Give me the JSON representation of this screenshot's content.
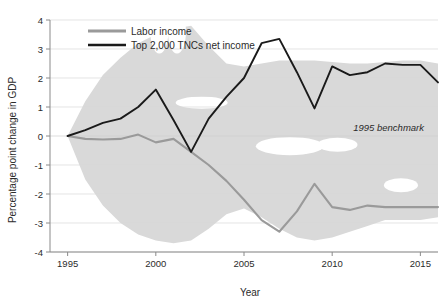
{
  "chart_data": {
    "type": "line",
    "title": "",
    "xlabel": "Year",
    "ylabel": "Percentage point change in GDP",
    "xlim": [
      1994,
      2016
    ],
    "ylim": [
      -4,
      4
    ],
    "grid": true,
    "legend_position": "top-left",
    "xticks": [
      1995,
      2000,
      2005,
      2010,
      2015
    ],
    "yticks": [
      -4,
      -3,
      -2,
      -1,
      0,
      1,
      2,
      3,
      4
    ],
    "xtick_labels": [
      "1995",
      "2000",
      "2005",
      "2010",
      "2015"
    ],
    "ytick_labels": [
      "-4",
      "-3",
      "-2",
      "-1",
      "0",
      "1",
      "2",
      "3",
      "4"
    ],
    "x": [
      1995,
      1996,
      1997,
      1998,
      1999,
      2000,
      2001,
      2002,
      2003,
      2004,
      2005,
      2006,
      2007,
      2008,
      2009,
      2010,
      2011,
      2012,
      2013,
      2014,
      2015,
      2016
    ],
    "series": [
      {
        "name": "Labor income",
        "color": "#9a9a9a",
        "values": [
          0.0,
          -0.1,
          -0.12,
          -0.1,
          0.05,
          -0.22,
          -0.1,
          -0.55,
          -1.0,
          -1.55,
          -2.2,
          -2.9,
          -3.3,
          -2.6,
          -1.65,
          -2.45,
          -2.55,
          -2.4,
          -2.45,
          -2.45,
          -2.45,
          -2.45
        ]
      },
      {
        "name": "Top 2,000 TNCs net income",
        "color": "#1a1a1a",
        "values": [
          0.0,
          0.2,
          0.45,
          0.6,
          1.0,
          1.6,
          0.55,
          -0.55,
          0.6,
          1.35,
          2.0,
          3.2,
          3.35,
          2.2,
          0.95,
          2.4,
          2.1,
          2.2,
          2.5,
          2.45,
          2.45,
          1.85
        ]
      }
    ],
    "band": {
      "name": "range-band",
      "color": "#d9d9d9",
      "upper": [
        0.0,
        1.2,
        2.1,
        2.7,
        3.2,
        3.5,
        3.7,
        3.8,
        3.1,
        2.5,
        2.4,
        2.5,
        2.6,
        2.6,
        2.6,
        2.55,
        2.5,
        2.5,
        2.55,
        2.6,
        2.6,
        2.5
      ],
      "lower": [
        0.0,
        -1.5,
        -2.4,
        -3.0,
        -3.4,
        -3.6,
        -3.7,
        -3.6,
        -3.2,
        -2.7,
        -2.5,
        -2.8,
        -3.2,
        -3.5,
        -3.6,
        -3.5,
        -3.3,
        -3.1,
        -2.9,
        -2.9,
        -2.9,
        -2.8
      ]
    },
    "annotations": [
      {
        "text": "1995 benchmark",
        "x": 2013.2,
        "y": 0.02,
        "style": "italic"
      }
    ],
    "legend": [
      {
        "label": "Labor income",
        "color": "#9a9a9a"
      },
      {
        "label": "Top 2,000 TNCs net income",
        "color": "#1a1a1a"
      }
    ]
  }
}
